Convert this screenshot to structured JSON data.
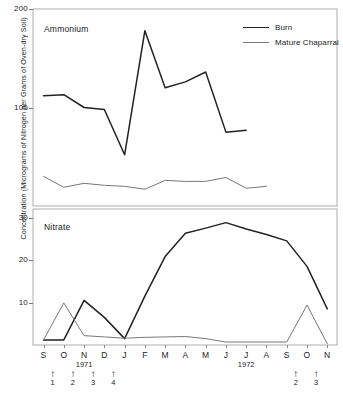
{
  "axis": {
    "ylabel": "Concentration (Micrograms of Nitrogen per Grams of Oven-dry Soil)",
    "ammonium_ticks": [
      "200",
      "100"
    ],
    "nitrate_ticks": [
      "30",
      "20",
      "10"
    ],
    "months": [
      "S",
      "O",
      "N",
      "D",
      "J",
      "F",
      "M",
      "A",
      "M",
      "J",
      "J",
      "A",
      "S",
      "O",
      "N"
    ],
    "year_left": "1971",
    "year_right": "1972"
  },
  "panels": {
    "ammonium_title": "Ammonium",
    "nitrate_title": "Nitrate"
  },
  "legend": {
    "position": "top-right",
    "items": [
      {
        "label": "Burn",
        "color": "#222222",
        "width": "1.9px"
      },
      {
        "label": "Mature Chaparral",
        "color": "#777777",
        "width": "1.1px"
      }
    ]
  },
  "arrows": [
    {
      "num": "1",
      "glyph": "↑",
      "month_index": 0.45
    },
    {
      "num": "2",
      "glyph": "↑",
      "month_index": 1.45
    },
    {
      "num": "3",
      "glyph": "↑",
      "month_index": 2.45
    },
    {
      "num": "4",
      "glyph": "↑",
      "month_index": 3.45
    },
    {
      "num": "2",
      "glyph": "↑",
      "month_index": 12.45
    },
    {
      "num": "3",
      "glyph": "↑",
      "month_index": 13.45
    }
  ],
  "chart_data": {
    "type": "line",
    "xlabel": "",
    "ylabel": "Concentration (Micrograms of Nitrogen per Grams of Oven-dry Soil)",
    "grid": false,
    "legend_position": "top-right",
    "x": [
      "S",
      "O",
      "N",
      "D",
      "J",
      "F",
      "M",
      "A",
      "M",
      "J",
      "J",
      "A",
      "S",
      "O",
      "N"
    ],
    "x_years": [
      "1971",
      "1971",
      "1971",
      "1971",
      "1972",
      "1972",
      "1972",
      "1972",
      "1972",
      "1972",
      "1972",
      "1972",
      "1972",
      "1972",
      "1972"
    ],
    "panels": [
      {
        "name": "Ammonium",
        "ylim": [
          0,
          200
        ],
        "yticks": [
          100,
          200
        ],
        "series": [
          {
            "name": "Burn",
            "color": "#222222",
            "values": [
              112,
              113,
              100,
              98,
              52,
              178,
              120,
              126,
              136,
              75,
              77,
              null,
              null,
              null,
              null
            ],
            "x": [
              "S",
              "O",
              "N",
              "D",
              "J",
              "F",
              "M",
              "A",
              "M",
              "J",
              "J"
            ]
          },
          {
            "name": "Mature Chaparral",
            "color": "#777777",
            "values": [
              30,
              19,
              23,
              21,
              20,
              17,
              26,
              25,
              25,
              29,
              18,
              20,
              null,
              null,
              null
            ],
            "x": [
              "S",
              "O",
              "N",
              "D",
              "J",
              "F",
              "M",
              "A",
              "M",
              "J",
              "J",
              "A"
            ]
          }
        ]
      },
      {
        "name": "Nitrate",
        "ylim": [
          0,
          32
        ],
        "yticks": [
          10,
          20,
          30
        ],
        "series": [
          {
            "name": "Burn",
            "color": "#222222",
            "values": [
              1.2,
              1.2,
              10.5,
              6.5,
              1.5,
              11.5,
              20.8,
              26.3,
              27.5,
              28.8,
              27.3,
              26.0,
              24.5,
              18.5,
              8.5
            ]
          },
          {
            "name": "Mature Chaparral",
            "color": "#777777",
            "values": [
              1.2,
              9.9,
              2.2,
              1.9,
              1.6,
              1.8,
              1.9,
              2.0,
              1.5,
              0.7,
              0.7,
              0.7,
              0.7,
              9.4,
              0.3
            ]
          }
        ]
      }
    ]
  }
}
